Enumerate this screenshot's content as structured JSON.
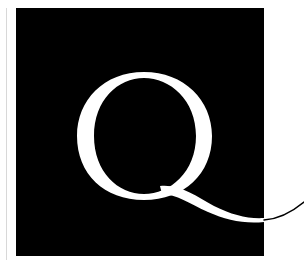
{
  "logo": {
    "letter": "Q",
    "background_color": "#000000",
    "letter_color": "#ffffff",
    "tail_outside_color": "#000000",
    "page_background": "#ffffff"
  }
}
